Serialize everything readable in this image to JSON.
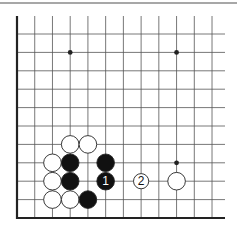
{
  "diagram": {
    "type": "go-board-corner",
    "grid": {
      "columns": 12,
      "rows": 11,
      "origin_x": 17,
      "origin_y": 34,
      "spacing_x": 17.73,
      "spacing_y": 18.4,
      "line_top": 16,
      "line_right": 225,
      "edges": [
        "left",
        "bottom"
      ]
    },
    "colors": {
      "line": "#555555",
      "edge": "#222222",
      "rule": "#8a8a8a",
      "black_stone": "#111111",
      "white_stone": "#ffffff",
      "stone_outline": "#222222"
    },
    "star_points": [
      {
        "col": 3,
        "row": 1
      },
      {
        "col": 9,
        "row": 1
      },
      {
        "col": 9,
        "row": 7
      }
    ],
    "stones": [
      {
        "color": "white",
        "col": 3,
        "row": 6,
        "label": ""
      },
      {
        "color": "white",
        "col": 4,
        "row": 6,
        "label": ""
      },
      {
        "color": "white",
        "col": 2,
        "row": 7,
        "label": ""
      },
      {
        "color": "black",
        "col": 3,
        "row": 7,
        "label": ""
      },
      {
        "color": "black",
        "col": 5,
        "row": 7,
        "label": ""
      },
      {
        "color": "white",
        "col": 2,
        "row": 8,
        "label": ""
      },
      {
        "color": "black",
        "col": 3,
        "row": 8,
        "label": ""
      },
      {
        "color": "black",
        "col": 5,
        "row": 8,
        "label": "1"
      },
      {
        "color": "white",
        "col": 7,
        "row": 8,
        "label": "2"
      },
      {
        "color": "white",
        "col": 9,
        "row": 8,
        "label": ""
      },
      {
        "color": "white",
        "col": 2,
        "row": 9,
        "label": ""
      },
      {
        "color": "white",
        "col": 3,
        "row": 9,
        "label": ""
      },
      {
        "color": "black",
        "col": 4,
        "row": 9,
        "label": ""
      }
    ],
    "move_labels": {
      "move_1": "1",
      "move_2": "2"
    }
  }
}
